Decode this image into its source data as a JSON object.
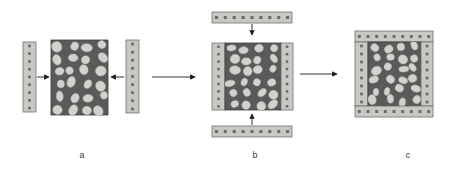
{
  "figure": {
    "title": "",
    "type": "assembly-process-diagram",
    "background_color": "#ffffff"
  },
  "palette": {
    "core_fill": "#5a5a5a",
    "core_stroke": "#3d3d3d",
    "blob_fill": "#d2d2cc",
    "blob_stroke": "#bdbdb6",
    "strip_fill": "#c8c8c3",
    "strip_stroke": "#6f6f6f",
    "dot_fill": "#6a6a6a",
    "arrow_color": "#1a1a1a",
    "label_color": "#3a3a3a"
  },
  "stages": [
    {
      "id": "a",
      "label": "a",
      "label_x": 82,
      "label_y": 150,
      "description": "Porous core block with two vertical reinforcement strips approaching from left and right",
      "parts": [
        {
          "name": "left-strip",
          "kind": "strip",
          "orientation": "vertical",
          "x": 23,
          "y": 42,
          "w": 13,
          "h": 70,
          "dot_rows": 9,
          "dot_cols": 1
        },
        {
          "name": "core-block",
          "kind": "core",
          "x": 51,
          "y": 40,
          "w": 57,
          "h": 75
        },
        {
          "name": "right-strip",
          "kind": "strip",
          "orientation": "vertical",
          "x": 126,
          "y": 40,
          "w": 13,
          "h": 73,
          "dot_rows": 9,
          "dot_cols": 1
        }
      ],
      "arrows": [
        {
          "name": "left-insert-arrow",
          "direction": "right",
          "x1": 37,
          "y1": 77,
          "x2": 49,
          "y2": 77
        },
        {
          "name": "right-insert-arrow",
          "direction": "left",
          "x1": 124,
          "y1": 77,
          "x2": 111,
          "y2": 77
        }
      ]
    },
    {
      "id": "b",
      "label": "b",
      "label_x": 255,
      "label_y": 150,
      "description": "Core with side strips bonded; horizontal strips approaching from top and bottom",
      "parts": [
        {
          "name": "top-strip",
          "kind": "strip",
          "orientation": "horizontal",
          "x": 212,
          "y": 12,
          "w": 80,
          "h": 11,
          "dot_rows": 1,
          "dot_cols": 9
        },
        {
          "name": "assembly-left-strip",
          "kind": "strip",
          "orientation": "vertical",
          "x": 212,
          "y": 43,
          "w": 13,
          "h": 67,
          "dot_rows": 9,
          "dot_cols": 1
        },
        {
          "name": "assembly-core-block",
          "kind": "core",
          "x": 225,
          "y": 43,
          "w": 56,
          "h": 67
        },
        {
          "name": "assembly-right-strip",
          "kind": "strip",
          "orientation": "vertical",
          "x": 281,
          "y": 43,
          "w": 12,
          "h": 67,
          "dot_rows": 9,
          "dot_cols": 1
        },
        {
          "name": "bottom-strip",
          "kind": "strip",
          "orientation": "horizontal",
          "x": 212,
          "y": 126,
          "w": 80,
          "h": 11,
          "dot_rows": 1,
          "dot_cols": 9
        }
      ],
      "arrows": [
        {
          "name": "top-insert-arrow",
          "direction": "down",
          "x1": 252,
          "y1": 24,
          "x2": 252,
          "y2": 35
        },
        {
          "name": "bottom-insert-arrow",
          "direction": "up",
          "x1": 252,
          "y1": 125,
          "x2": 252,
          "y2": 114
        }
      ]
    },
    {
      "id": "c",
      "label": "c",
      "label_x": 408,
      "label_y": 150,
      "description": "Completed assembly with reinforcement strips framing all four sides of the porous core",
      "parts": [
        {
          "name": "final-top-strip",
          "kind": "strip",
          "orientation": "horizontal",
          "x": 355,
          "y": 31,
          "w": 78,
          "h": 11,
          "dot_rows": 1,
          "dot_cols": 9
        },
        {
          "name": "final-left-strip",
          "kind": "strip",
          "orientation": "vertical",
          "x": 355,
          "y": 42,
          "w": 13,
          "h": 64,
          "dot_rows": 8,
          "dot_cols": 1
        },
        {
          "name": "final-core-block",
          "kind": "core",
          "x": 368,
          "y": 42,
          "w": 53,
          "h": 64
        },
        {
          "name": "final-right-strip",
          "kind": "strip",
          "orientation": "vertical",
          "x": 421,
          "y": 42,
          "w": 12,
          "h": 64,
          "dot_rows": 8,
          "dot_cols": 1
        },
        {
          "name": "final-bottom-strip",
          "kind": "strip",
          "orientation": "horizontal",
          "x": 355,
          "y": 106,
          "w": 78,
          "h": 11,
          "dot_rows": 1,
          "dot_cols": 9
        }
      ],
      "arrows": []
    }
  ],
  "transition_arrows": [
    {
      "name": "arrow-a-to-b",
      "from": "a",
      "to": "b",
      "x1": 152,
      "y1": 77,
      "x2": 195,
      "y2": 77
    },
    {
      "name": "arrow-b-to-c",
      "from": "b",
      "to": "c",
      "x1": 300,
      "y1": 74,
      "x2": 337,
      "y2": 74
    }
  ]
}
